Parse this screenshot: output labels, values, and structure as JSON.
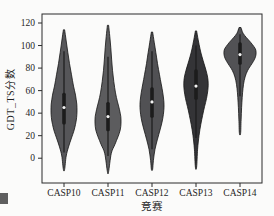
{
  "figure": {
    "background": "#fbfbfa",
    "frame_color": "#2b2b2b"
  },
  "chart_data": {
    "type": "violin",
    "title": "",
    "xlabel": "竞赛",
    "ylabel": "GDT_TS分数",
    "categories": [
      "CASP10",
      "CASP11",
      "CASP12",
      "CASP13",
      "CASP14"
    ],
    "yticks": [
      0,
      20,
      40,
      60,
      80,
      100,
      120
    ],
    "ylim": [
      -22,
      128
    ],
    "grid": false,
    "legend": "none",
    "edge_color": "#141414",
    "box_color": "#1c1c1c",
    "median_dot_color": "#f2f2f2",
    "series": [
      {
        "name": "CASP10",
        "median": 45,
        "q1": 30,
        "q3": 58,
        "whisker_low": 5,
        "whisker_high": 95,
        "min": -10,
        "max": 114,
        "fill": "#565659",
        "profile": [
          [
            114,
            0.6
          ],
          [
            104,
            2.2
          ],
          [
            94,
            3.8
          ],
          [
            84,
            5.5
          ],
          [
            74,
            7.5
          ],
          [
            64,
            9.5
          ],
          [
            56,
            11.5
          ],
          [
            48,
            12.8
          ],
          [
            42,
            13
          ],
          [
            36,
            12.6
          ],
          [
            30,
            11.5
          ],
          [
            24,
            9.8
          ],
          [
            18,
            7.5
          ],
          [
            10,
            4.5
          ],
          [
            2,
            2.2
          ],
          [
            -10,
            0.6
          ]
        ]
      },
      {
        "name": "CASP11",
        "median": 37,
        "q1": 24,
        "q3": 50,
        "whisker_low": 2,
        "whisker_high": 90,
        "min": -12,
        "max": 118,
        "fill": "#5c5c5e",
        "profile": [
          [
            118,
            0.6
          ],
          [
            108,
            1.8
          ],
          [
            98,
            2.8
          ],
          [
            88,
            3.6
          ],
          [
            78,
            4.5
          ],
          [
            68,
            5.8
          ],
          [
            58,
            7.5
          ],
          [
            50,
            9.5
          ],
          [
            43,
            11.5
          ],
          [
            37,
            12.8
          ],
          [
            31,
            13
          ],
          [
            25,
            12.2
          ],
          [
            19,
            10
          ],
          [
            12,
            6.8
          ],
          [
            4,
            3.2
          ],
          [
            -12,
            0.6
          ]
        ]
      },
      {
        "name": "CASP12",
        "median": 50,
        "q1": 36,
        "q3": 63,
        "whisker_low": 8,
        "whisker_high": 95,
        "min": -10,
        "max": 112,
        "fill": "#515154",
        "profile": [
          [
            112,
            0.6
          ],
          [
            103,
            2.2
          ],
          [
            94,
            3.8
          ],
          [
            84,
            5.5
          ],
          [
            74,
            7.5
          ],
          [
            66,
            9.2
          ],
          [
            58,
            10.8
          ],
          [
            51,
            11.8
          ],
          [
            45,
            12
          ],
          [
            39,
            11.4
          ],
          [
            32,
            10
          ],
          [
            25,
            8
          ],
          [
            17,
            5.5
          ],
          [
            8,
            3
          ],
          [
            -2,
            1.4
          ],
          [
            -10,
            0.6
          ]
        ]
      },
      {
        "name": "CASP13",
        "median": 64,
        "q1": 52,
        "q3": 79,
        "whisker_low": 18,
        "whisker_high": 100,
        "min": -8,
        "max": 113,
        "fill": "#343437",
        "profile": [
          [
            113,
            0.6
          ],
          [
            105,
            2.2
          ],
          [
            97,
            4
          ],
          [
            90,
            6
          ],
          [
            84,
            8
          ],
          [
            78,
            10
          ],
          [
            72,
            11.6
          ],
          [
            66,
            12.2
          ],
          [
            60,
            11.8
          ],
          [
            53,
            10.5
          ],
          [
            46,
            8.6
          ],
          [
            38,
            6.6
          ],
          [
            30,
            4.8
          ],
          [
            20,
            3
          ],
          [
            8,
            1.6
          ],
          [
            -8,
            0.6
          ]
        ]
      },
      {
        "name": "CASP14",
        "median": 92,
        "q1": 83,
        "q3": 103,
        "whisker_low": 55,
        "whisker_high": 110,
        "min": 22,
        "max": 116,
        "fill": "#525255",
        "profile": [
          [
            116,
            1
          ],
          [
            111,
            3
          ],
          [
            107,
            6.5
          ],
          [
            103,
            10.5
          ],
          [
            99,
            14
          ],
          [
            96,
            15.8
          ],
          [
            92,
            16
          ],
          [
            88,
            14.6
          ],
          [
            84,
            12
          ],
          [
            80,
            9
          ],
          [
            75,
            6.2
          ],
          [
            69,
            4.2
          ],
          [
            62,
            3
          ],
          [
            54,
            2.2
          ],
          [
            45,
            1.6
          ],
          [
            34,
            1.1
          ],
          [
            22,
            0.6
          ]
        ]
      }
    ]
  }
}
